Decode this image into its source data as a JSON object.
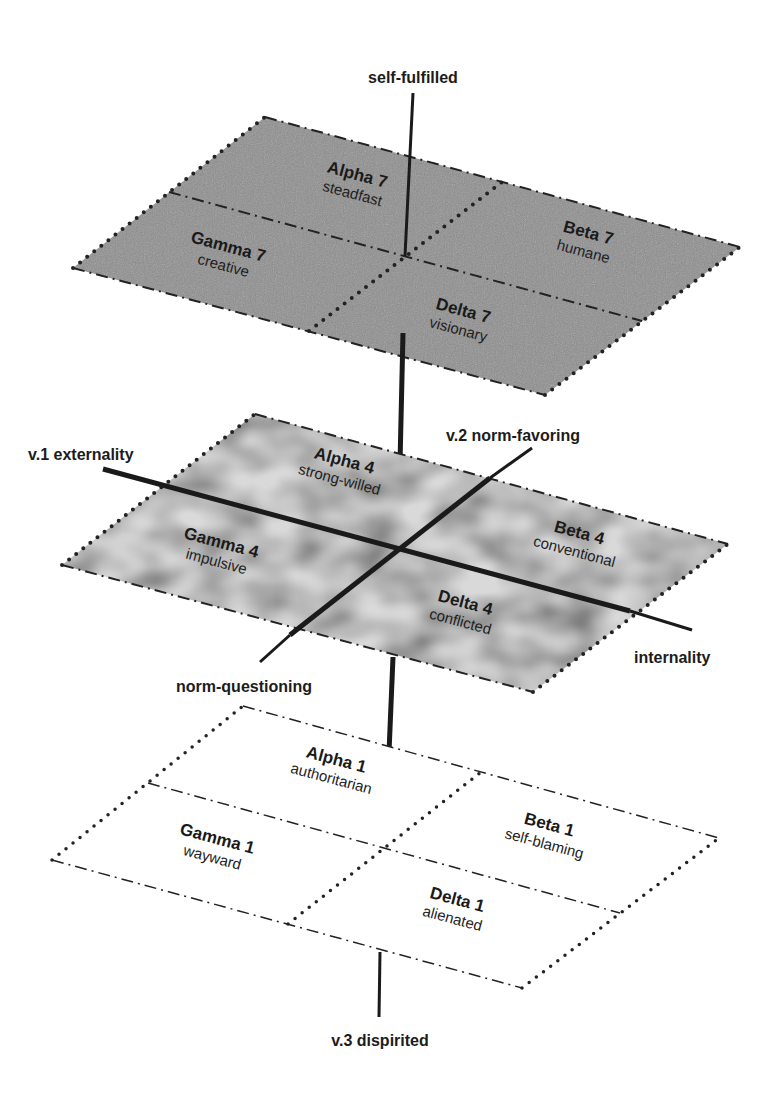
{
  "diagram": {
    "type": "3d-layered-typology",
    "colors": {
      "top_plane_fill": "#8e8e8e",
      "middle_plane_fill": "#d6d6d6",
      "bottom_plane_fill": "#ffffff",
      "line": "#1a1a1a",
      "text": "#1a1a1a"
    },
    "axes": {
      "v1_positive": "v.1 externality",
      "v1_negative": "internality",
      "v2_positive": "v.2 norm-favoring",
      "v2_negative": "norm-questioning",
      "v3_top": "self-fulfilled",
      "v3_bottom": "v.3 dispirited"
    },
    "planes": [
      {
        "level": 7,
        "quadrants": {
          "alpha": {
            "name": "Alpha 7",
            "desc": "steadfast"
          },
          "beta": {
            "name": "Beta 7",
            "desc": "humane"
          },
          "gamma": {
            "name": "Gamma 7",
            "desc": "creative"
          },
          "delta": {
            "name": "Delta 7",
            "desc": "visionary"
          }
        }
      },
      {
        "level": 4,
        "quadrants": {
          "alpha": {
            "name": "Alpha 4",
            "desc": "strong-willed"
          },
          "beta": {
            "name": "Beta 4",
            "desc": "conventional"
          },
          "gamma": {
            "name": "Gamma 4",
            "desc": "impulsive"
          },
          "delta": {
            "name": "Delta 4",
            "desc": "conflicted"
          }
        }
      },
      {
        "level": 1,
        "quadrants": {
          "alpha": {
            "name": "Alpha 1",
            "desc": "authoritarian"
          },
          "beta": {
            "name": "Beta 1",
            "desc": "self-blaming"
          },
          "gamma": {
            "name": "Gamma 1",
            "desc": "wayward"
          },
          "delta": {
            "name": "Delta 1",
            "desc": "alienated"
          }
        }
      }
    ]
  }
}
